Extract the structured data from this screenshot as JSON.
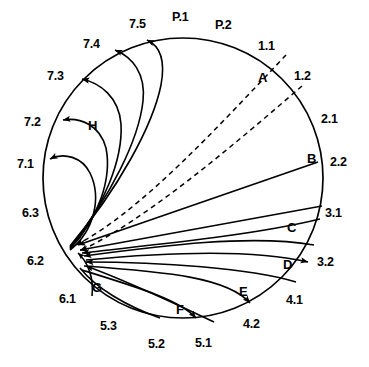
{
  "figure": {
    "type": "circular-projection-diagram",
    "circle": {
      "center_x": 183,
      "center_y": 178,
      "radius": 140,
      "stroke": "#000000",
      "stroke_width": 1.6
    },
    "convergence_point": {
      "x": 70,
      "y": 248
    },
    "stroke_color": "#000000"
  },
  "labels": {
    "circumference": [
      {
        "id": "7.5",
        "text": "7.5",
        "x": 129,
        "y": 18,
        "kind": "num"
      },
      {
        "id": "P.1",
        "text": "P.1",
        "x": 172,
        "y": 11,
        "kind": "pnum"
      },
      {
        "id": "P.2",
        "text": "P.2",
        "x": 215,
        "y": 19,
        "kind": "pnum"
      },
      {
        "id": "1.1",
        "text": "1.1",
        "x": 258,
        "y": 40,
        "kind": "num"
      },
      {
        "id": "1.2",
        "text": "1.2",
        "x": 294,
        "y": 70,
        "kind": "num"
      },
      {
        "id": "2.1",
        "text": "2.1",
        "x": 321,
        "y": 113,
        "kind": "num"
      },
      {
        "id": "2.2",
        "text": "2.2",
        "x": 330,
        "y": 156,
        "kind": "num"
      },
      {
        "id": "3.1",
        "text": "3.1",
        "x": 325,
        "y": 207,
        "kind": "num"
      },
      {
        "id": "3.2",
        "text": "3.2",
        "x": 317,
        "y": 256,
        "kind": "num"
      },
      {
        "id": "4.1",
        "text": "4.1",
        "x": 286,
        "y": 294,
        "kind": "num"
      },
      {
        "id": "4.2",
        "text": "4.2",
        "x": 243,
        "y": 318,
        "kind": "num"
      },
      {
        "id": "5.1",
        "text": "5.1",
        "x": 195,
        "y": 337,
        "kind": "num"
      },
      {
        "id": "5.2",
        "text": "5.2",
        "x": 148,
        "y": 338,
        "kind": "num"
      },
      {
        "id": "5.3",
        "text": "5.3",
        "x": 100,
        "y": 320,
        "kind": "num"
      },
      {
        "id": "6.1",
        "text": "6.1",
        "x": 59,
        "y": 293,
        "kind": "num"
      },
      {
        "id": "6.2",
        "text": "6.2",
        "x": 27,
        "y": 255,
        "kind": "num"
      },
      {
        "id": "6.3",
        "text": "6.3",
        "x": 22,
        "y": 207,
        "kind": "num"
      },
      {
        "id": "7.1",
        "text": "7.1",
        "x": 17,
        "y": 158,
        "kind": "num"
      },
      {
        "id": "7.2",
        "text": "7.2",
        "x": 24,
        "y": 116,
        "kind": "num"
      },
      {
        "id": "7.3",
        "text": "7.3",
        "x": 47,
        "y": 70,
        "kind": "num"
      },
      {
        "id": "7.4",
        "text": "7.4",
        "x": 83,
        "y": 38,
        "kind": "num"
      }
    ],
    "tracts": [
      {
        "id": "A",
        "text": "A",
        "x": 258,
        "y": 71,
        "kind": "letter"
      },
      {
        "id": "B",
        "text": "B",
        "x": 307,
        "y": 152,
        "kind": "letter"
      },
      {
        "id": "C",
        "text": "C",
        "x": 287,
        "y": 228,
        "kind": "letter"
      },
      {
        "id": "D",
        "text": "D",
        "x": 283,
        "y": 262,
        "kind": "letter"
      },
      {
        "id": "E",
        "text": "E",
        "x": 239,
        "y": 287,
        "kind": "letter"
      },
      {
        "id": "F",
        "text": "F",
        "x": 176,
        "y": 307,
        "kind": "letter"
      },
      {
        "id": "G",
        "text": "G",
        "x": 92,
        "y": 283,
        "kind": "letter"
      },
      {
        "id": "H",
        "text": "H",
        "x": 88,
        "y": 123,
        "kind": "letter"
      }
    ]
  },
  "paths": {
    "dashed": [
      {
        "id": "A-upper",
        "d": "M 70 248 C 140 212 215 130 286 55",
        "dash": "5,4"
      },
      {
        "id": "A-lower",
        "d": "M 70 248 C 145 220 228 150 302 86",
        "dash": "5,4"
      }
    ],
    "solid_straight": [
      {
        "id": "B-tract",
        "d": "M 70 248 L 318 162"
      },
      {
        "id": "C-upper",
        "d": "M 70 248 L 322 206"
      }
    ],
    "solid_curved_inbound": [
      {
        "id": "C-tract",
        "d": "M 70 250 C 150 239 245 222 318 204"
      },
      {
        "id": "C-lower",
        "d": "M 70 252 C 150 246 250 238 320 221"
      },
      {
        "id": "D-tract",
        "d": "M 70 256 C 160 249 250 238 313 247"
      },
      {
        "id": "D-ret",
        "d": "M 70 259 C 160 256 250 250 305 262"
      },
      {
        "id": "E-tract",
        "d": "M 70 262 C 160 266 248 272 290 288"
      },
      {
        "id": "F-tract",
        "d": "M 70 265 C 150 280 215 300 238 314"
      },
      {
        "id": "F-in2",
        "d": "M 70 267 C 140 288 180 305 196 322"
      },
      {
        "id": "G-tract",
        "d": "M 70 268 C 118 286 150 306 160 320"
      },
      {
        "id": "G-short",
        "d": "M 70 252 C 84 262 90 280 88 296"
      }
    ],
    "solid_curved_outbound_H": [
      {
        "id": "H-71",
        "d": "M 70 250 C 92 230 100 198 88 172 C 80 156 62 152 46 160"
      },
      {
        "id": "H-72",
        "d": "M 70 249 C 98 218 110 178 104 148 C 98 125 78 118 60 120"
      },
      {
        "id": "H-73",
        "d": "M 70 248 C 104 206 122 158 120 124 C 118 96 98 82 78 78"
      },
      {
        "id": "H-74",
        "d": "M 70 247 C 110 196 138 138 142 100 C 145 72 130 56 112 48"
      },
      {
        "id": "H-75",
        "d": "M 70 246 C 118 188 152 124 160 84 C 166 56 158 44 146 38"
      }
    ]
  },
  "arrowheads": {
    "note": "filled triangular heads at tract terminations",
    "color": "#000000"
  }
}
